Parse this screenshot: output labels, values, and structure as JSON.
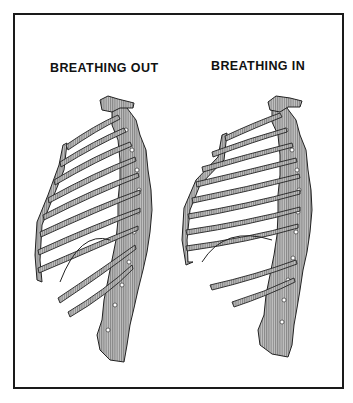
{
  "figure": {
    "panels": [
      {
        "id": "out",
        "label": "BREATHING OUT"
      },
      {
        "id": "in",
        "label": "BREATHING IN"
      }
    ],
    "colors": {
      "frame": "#1a1a1a",
      "bone_fill": "#a8a8a8",
      "outline": "#222222",
      "background": "#ffffff"
    }
  }
}
